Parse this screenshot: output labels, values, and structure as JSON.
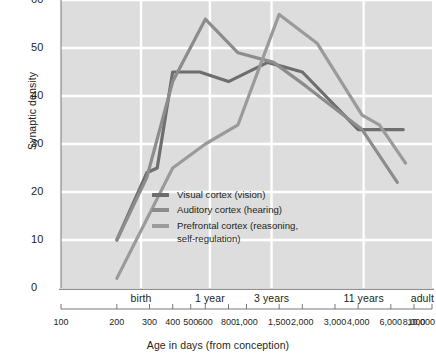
{
  "chart_data": {
    "type": "line",
    "title": "",
    "xlabel": "Age in days (from conception)",
    "ylabel": "Synaptic density",
    "xscale": "log",
    "xlim": [
      100,
      10000
    ],
    "ylim": [
      0,
      60
    ],
    "grid": true,
    "legend_position": "inside-center",
    "ytick_labels": [
      "0",
      "10",
      "20",
      "30",
      "40",
      "50",
      "60"
    ],
    "ytick_values": [
      0,
      10,
      20,
      30,
      40,
      50,
      60
    ],
    "xtick_labels": [
      "100",
      "200",
      "300",
      "400",
      "500",
      "600",
      "800",
      "1,000",
      "1,500",
      "2,000",
      "3,000",
      "4,000",
      "6,000",
      "8,000",
      "10,000"
    ],
    "xtick_values": [
      100,
      200,
      300,
      400,
      500,
      600,
      800,
      1000,
      1500,
      2000,
      3000,
      4000,
      6000,
      8000,
      10000
    ],
    "xcategory_labels": [
      "birth",
      "1 year",
      "3 years",
      "11 years",
      "adult"
    ],
    "xcategory_values": [
      270,
      635,
      1365,
      4280,
      10000
    ],
    "series": [
      {
        "name": "Visual cortex (vision)",
        "color": "#6e6e6e",
        "x": [
          200,
          290,
          330,
          400,
          560,
          800,
          1300,
          2000,
          4000,
          5500,
          7000
        ],
        "values": [
          10,
          24,
          25,
          45,
          45,
          43,
          47,
          45,
          33,
          33,
          33
        ]
      },
      {
        "name": "Auditory cortex (hearing)",
        "color": "#8c8c8c",
        "x": [
          200,
          290,
          400,
          600,
          900,
          1400,
          2100,
          4200,
          6500
        ],
        "values": [
          10,
          23,
          43,
          56,
          49,
          47,
          42,
          33,
          22
        ]
      },
      {
        "name": "Prefrontal cortex (reasoning,\nself-regulation)",
        "color": "#9a9a9a",
        "x": [
          200,
          400,
          600,
          900,
          1500,
          2400,
          4200,
          5200,
          7200
        ],
        "values": [
          2,
          25,
          30,
          34,
          57,
          51,
          36,
          34,
          26
        ]
      }
    ]
  },
  "axes": {
    "ylabel": "Synaptic density",
    "xlabel": "Age in days (from conception)"
  },
  "legend": {
    "items": [
      {
        "label": "Visual cortex (vision)",
        "color": "#6e6e6e"
      },
      {
        "label": "Auditory cortex (hearing)",
        "color": "#8c8c8c"
      },
      {
        "label": "Prefrontal cortex (reasoning,\nself-regulation)",
        "color": "#9a9a9a"
      }
    ]
  },
  "colors": {
    "plot_background": "#dddddd",
    "gridline": "#ffffff",
    "axis_line": "#6a6a6a",
    "text": "#231f20"
  }
}
